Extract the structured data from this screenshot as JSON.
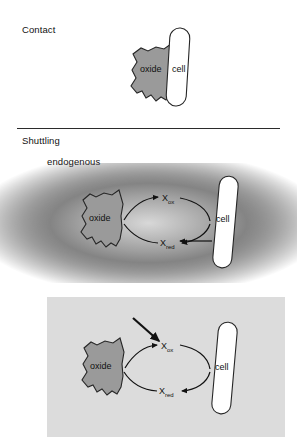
{
  "figure": {
    "title_contact": "Contact",
    "title_shuttling": "Shuttling",
    "subtitle_endogenous": "endogenous",
    "subtitle_exogenous": "exogenous",
    "colors": {
      "oxide_fill": "#9a9a9a",
      "cell_fill": "#ffffff",
      "stroke": "#262626",
      "exogenous_panel": "#dcdcdc",
      "gradient_dark": "#4a4a4a",
      "background": "#ffffff"
    }
  },
  "panels": {
    "contact": {
      "heading": "Contact",
      "oxide_label": "oxide",
      "cell_label": "cell",
      "background": "white",
      "description": "oxide in direct contact with cell"
    },
    "endogenous": {
      "heading": "endogenous",
      "oxide_label": "oxide",
      "cell_label": "cell",
      "shuttle_ox": "X",
      "shuttle_ox_sub": "ox",
      "shuttle_red": "X",
      "shuttle_red_sub": "red",
      "background": "radial-gradient-dark",
      "description": "cell secretes shuttle; cycle between oxide and cell"
    },
    "exogenous": {
      "heading": "exogenous",
      "oxide_label": "oxide",
      "cell_label": "cell",
      "shuttle_ox": "X",
      "shuttle_ox_sub": "ox",
      "shuttle_red": "X",
      "shuttle_red_sub": "red",
      "background": "light-gray-panel",
      "description": "shuttle added externally, arrow entering from outside"
    }
  }
}
